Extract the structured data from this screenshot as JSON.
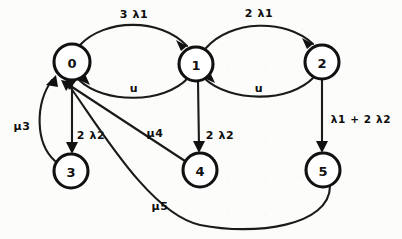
{
  "diagram": {
    "type": "state-transition-graph",
    "nodes": [
      {
        "id": "0",
        "label": "0",
        "cx": 72,
        "cy": 62,
        "r": 18
      },
      {
        "id": "1",
        "label": "1",
        "cx": 196,
        "cy": 64,
        "r": 17
      },
      {
        "id": "2",
        "label": "2",
        "cx": 322,
        "cy": 62,
        "r": 17
      },
      {
        "id": "3",
        "label": "3",
        "cx": 71,
        "cy": 171,
        "r": 17
      },
      {
        "id": "4",
        "label": "4",
        "cx": 200,
        "cy": 170,
        "r": 17
      },
      {
        "id": "5",
        "label": "5",
        "cx": 323,
        "cy": 170,
        "r": 17
      }
    ],
    "edges": [
      {
        "id": "e0-1",
        "from": "0",
        "to": "1",
        "label": "3 λ1",
        "label_x": 134,
        "label_y": 14
      },
      {
        "id": "e1-2",
        "from": "1",
        "to": "2",
        "label": "2 λ1",
        "label_x": 259,
        "label_y": 13
      },
      {
        "id": "e1-0",
        "from": "1",
        "to": "0",
        "label": "u",
        "label_x": 134,
        "label_y": 88
      },
      {
        "id": "e2-1",
        "from": "2",
        "to": "1",
        "label": "u",
        "label_x": 259,
        "label_y": 88
      },
      {
        "id": "e0-3",
        "from": "0",
        "to": "3",
        "label": "2 λ2",
        "label_x": 91,
        "label_y": 135
      },
      {
        "id": "e1-4",
        "from": "1",
        "to": "4",
        "label": "2 λ2",
        "label_x": 220,
        "label_y": 135
      },
      {
        "id": "e2-5",
        "from": "2",
        "to": "5",
        "label": "λ1 + 2 λ2",
        "label_x": 360,
        "label_y": 119
      },
      {
        "id": "e3-0",
        "from": "3",
        "to": "0",
        "label": "μ3",
        "label_x": 22,
        "label_y": 126
      },
      {
        "id": "e4-0",
        "from": "4",
        "to": "0",
        "label": "μ4",
        "label_x": 155,
        "label_y": 133
      },
      {
        "id": "e5-0",
        "from": "5",
        "to": "0",
        "label": "μ5",
        "label_x": 160,
        "label_y": 206
      }
    ],
    "labels": {
      "node_0": "0",
      "node_1": "1",
      "node_2": "2",
      "node_3": "3",
      "node_4": "4",
      "node_5": "5",
      "lambda_3_1": "3 λ1",
      "lambda_2_1": "2 λ1",
      "u_left": "u",
      "u_right": "u",
      "lambda_2_2_left": "2 λ2",
      "lambda_2_2_mid": "2 λ2",
      "lambda_sum": "λ1 + 2 λ2",
      "mu_3": "μ3",
      "mu_4": "μ4",
      "mu_5": "μ5"
    },
    "colors": {
      "stroke": "#111111",
      "fill": "#ffffff",
      "background": "#fcfcfb"
    }
  }
}
